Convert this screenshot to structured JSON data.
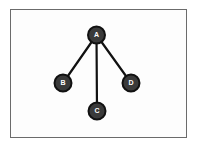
{
  "diagram": {
    "frame": {
      "border_color": "#6b6b6b",
      "background_color": "#fdfdfd"
    },
    "style": {
      "node_fill": "#3a3a3a",
      "node_stroke": "#111111",
      "node_radius": 8.5,
      "node_stroke_width": 2,
      "label_color": "#ffffff",
      "label_font_size": 7,
      "edge_color": "#111111",
      "edge_width": 2.2
    },
    "nodes": [
      {
        "id": "A",
        "label": "A",
        "x": 96.5,
        "y": 35
      },
      {
        "id": "B",
        "label": "B",
        "x": 63,
        "y": 83
      },
      {
        "id": "C",
        "label": "C",
        "x": 97,
        "y": 111
      },
      {
        "id": "D",
        "label": "D",
        "x": 131,
        "y": 83
      }
    ],
    "edges": [
      {
        "id": "A-B",
        "source": "A",
        "target": "B",
        "x1": 96.5,
        "y1": 35,
        "x2": 63,
        "y2": 83
      },
      {
        "id": "A-C",
        "source": "A",
        "target": "C",
        "x1": 96.5,
        "y1": 35,
        "x2": 97,
        "y2": 111
      },
      {
        "id": "A-D",
        "source": "A",
        "target": "D",
        "x1": 96.5,
        "y1": 35,
        "x2": 131,
        "y2": 83
      }
    ]
  }
}
